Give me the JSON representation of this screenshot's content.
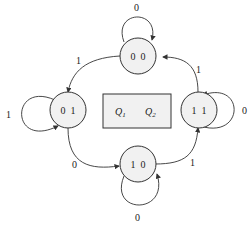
{
  "diagram": {
    "type": "state-transition",
    "legend": {
      "q1": "Q",
      "q1_sub": "1",
      "q2": "Q",
      "q2_sub": "2",
      "sup": "′"
    },
    "states": [
      {
        "id": "s00",
        "label": "0  0"
      },
      {
        "id": "s01",
        "label": "0  1"
      },
      {
        "id": "s11",
        "label": "1  1"
      },
      {
        "id": "s10",
        "label": "1  0"
      }
    ],
    "transitions": [
      {
        "from": "s00",
        "to": "s00",
        "label": "0"
      },
      {
        "from": "s00",
        "to": "s01",
        "label": "1"
      },
      {
        "from": "s01",
        "to": "s01",
        "label": "1"
      },
      {
        "from": "s01",
        "to": "s10",
        "label": "0"
      },
      {
        "from": "s10",
        "to": "s10",
        "label": "0"
      },
      {
        "from": "s10",
        "to": "s11",
        "label": "1"
      },
      {
        "from": "s11",
        "to": "s11",
        "label": "0"
      },
      {
        "from": "s11",
        "to": "s00",
        "label": "1"
      }
    ]
  }
}
